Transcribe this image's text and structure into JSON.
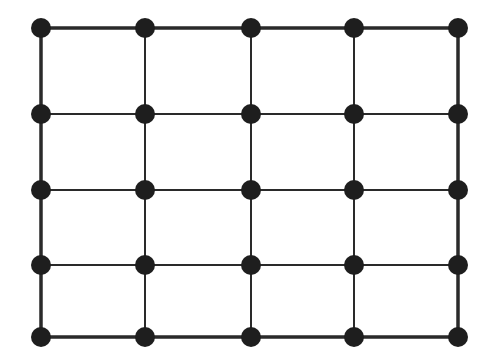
{
  "diagram": {
    "type": "grid-graph",
    "rows": 5,
    "cols": 5,
    "node_color": "#1e1e1e",
    "edge_color": "#2a2a2a",
    "node_radius": 10,
    "inner_edge_width": 2,
    "outer_edge_width": 3.5,
    "col_x": [
      41,
      145,
      251,
      354,
      458
    ],
    "row_y": [
      28,
      114,
      190,
      265,
      337
    ]
  }
}
